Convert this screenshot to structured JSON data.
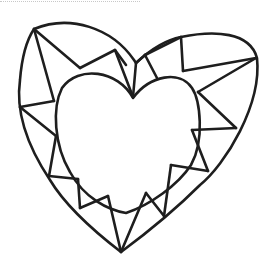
{
  "diagram": {
    "stroke_color": "#1e1e1e",
    "background_color": "#ffffff",
    "outer_outline": "M34,29 C70,14 112,28 134,60 L136,63 C150,50 165,40 181,37 C215,30 250,32 257,58 C262,105 225,165 200,185 C175,210 148,232 121,252 C95,232 65,205 50,180 C30,150 15,115 20,80 C22,55 28,38 34,29 Z",
    "inner_outline": "M133,98 C118,70 78,65 62,88 C52,108 54,145 70,172 C84,198 108,210 126,213 C150,205 178,185 191,165 C205,140 200,100 192,88 C180,70 150,75 133,98 Z",
    "facets": [
      [
        34,
        29,
        54,
        101
      ],
      [
        34,
        29,
        80,
        68
      ],
      [
        80,
        68,
        115,
        50
      ],
      [
        115,
        50,
        133,
        97
      ],
      [
        115,
        50,
        126,
        65
      ],
      [
        136,
        63,
        133,
        97
      ],
      [
        136,
        63,
        145,
        55
      ],
      [
        145,
        55,
        157,
        78
      ],
      [
        145,
        55,
        181,
        37
      ],
      [
        181,
        37,
        183,
        71
      ],
      [
        183,
        71,
        256,
        58
      ],
      [
        256,
        58,
        198,
        92
      ],
      [
        198,
        92,
        236,
        128
      ],
      [
        236,
        128,
        192,
        130
      ],
      [
        192,
        130,
        208,
        171
      ],
      [
        208,
        171,
        171,
        165
      ],
      [
        171,
        165,
        164,
        216
      ],
      [
        164,
        216,
        146,
        193
      ],
      [
        146,
        193,
        121,
        252
      ],
      [
        121,
        252,
        108,
        196
      ],
      [
        108,
        196,
        80,
        208
      ],
      [
        80,
        208,
        78,
        179
      ],
      [
        78,
        179,
        49,
        176
      ],
      [
        49,
        176,
        56,
        136
      ],
      [
        56,
        136,
        20,
        107
      ],
      [
        20,
        107,
        54,
        101
      ]
    ]
  }
}
